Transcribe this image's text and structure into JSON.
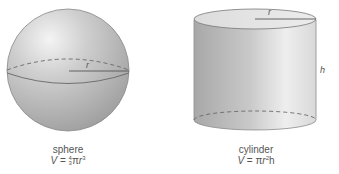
{
  "figures": [
    {
      "name": "sphere",
      "radius_label": "r",
      "formula": {
        "lhs": "V",
        "eq": " = ",
        "frac_num": "4",
        "frac_den": "3",
        "pi": "π",
        "var": "r",
        "exp": "3"
      }
    },
    {
      "name": "cylinder",
      "radius_label": "r",
      "height_label": "h",
      "formula": {
        "lhs": "V",
        "eq": " = ",
        "pi": "π",
        "var": "r",
        "exp": "2",
        "tail": "h"
      }
    }
  ],
  "colors": {
    "shape_fill": "#b4b4b4",
    "shape_light": "#e6e6e6",
    "outline": "#6e6e6e",
    "text": "#555555"
  }
}
